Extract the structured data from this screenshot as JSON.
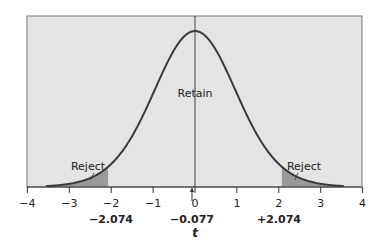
{
  "chart_data": {
    "type": "area",
    "title": "",
    "xlabel": "t",
    "ylabel": "",
    "distribution": "t-distribution (two-tailed test)",
    "xlim": [
      -4,
      4
    ],
    "x_ticks": [
      -4,
      -3,
      -2,
      -1,
      0,
      1,
      2,
      3,
      4
    ],
    "x_tick_labels": [
      "−4",
      "−3",
      "−2",
      "−1",
      "0",
      "1",
      "2",
      "3",
      "4"
    ],
    "grid": false,
    "legend": null,
    "curve_range": [
      -3.55,
      3.55
    ],
    "critical_values": [
      {
        "value": -2.074,
        "label": "−2.074"
      },
      {
        "value": 2.074,
        "label": "+2.074"
      }
    ],
    "observed_statistic": {
      "value": -0.077,
      "label": "−0.077",
      "marker": "arrow"
    },
    "regions": [
      {
        "name": "Reject",
        "from": -3.55,
        "to": -2.074,
        "shaded": true
      },
      {
        "name": "Retain",
        "from": -2.074,
        "to": 2.074,
        "shaded": false
      },
      {
        "name": "Reject",
        "from": 2.074,
        "to": 3.55,
        "shaded": true
      }
    ],
    "annotations": [
      "Retain",
      "Reject",
      "Reject"
    ]
  },
  "labels": {
    "retain": "Retain",
    "reject_left": "Reject",
    "reject_right": "Reject",
    "axis_title": "t",
    "crit_left": "−2.074",
    "crit_right": "+2.074",
    "observed": "−0.077"
  },
  "colors": {
    "background": "#e4e4e4",
    "frame": "#8a8a8a",
    "curve": "#3a3a3a",
    "shade": "#9a9a9a",
    "axis": "#333333"
  }
}
